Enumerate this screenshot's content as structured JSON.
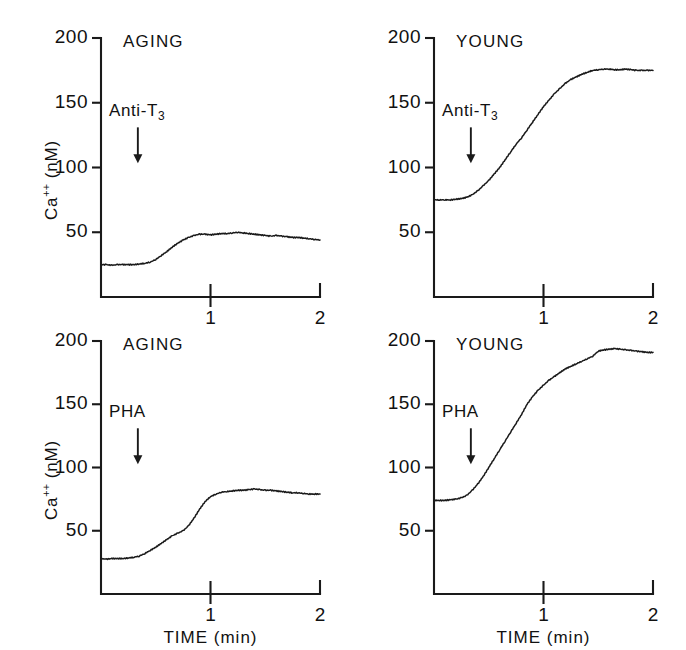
{
  "figure": {
    "background": "#ffffff",
    "ink_color": "#1a1a1a",
    "axis_label_y": "Ca++ (nM)",
    "axis_label_y_base": "Ca",
    "axis_label_y_sup": "++",
    "axis_label_y_unit": " (nM)",
    "axis_label_x": "TIME (min)"
  },
  "chart_data": [
    {
      "id": "aging-anti-t3",
      "type": "line",
      "title": "AGING",
      "annotation": "Anti-T3",
      "annotation_base": "Anti-T",
      "annotation_sub": "3",
      "annotation_time": 0.3,
      "xlabel": "TIME (min)",
      "ylabel": "Ca++ (nM)",
      "xlim": [
        0,
        2
      ],
      "ylim": [
        0,
        200
      ],
      "yticks": [
        50,
        100,
        150,
        200
      ],
      "ytick_labels": [
        "50",
        "100",
        "150",
        "200"
      ],
      "xticks": [
        1,
        2
      ],
      "xtick_labels": [
        "1",
        "2"
      ],
      "grid": false,
      "legend": "none",
      "baseline_value": 25,
      "peak_value": 50,
      "final_value": 44,
      "x": [
        0.0,
        0.05,
        0.1,
        0.15,
        0.2,
        0.25,
        0.3,
        0.35,
        0.4,
        0.45,
        0.5,
        0.55,
        0.6,
        0.65,
        0.7,
        0.75,
        0.8,
        0.85,
        0.9,
        0.95,
        1.0,
        1.05,
        1.1,
        1.15,
        1.2,
        1.25,
        1.3,
        1.35,
        1.4,
        1.45,
        1.5,
        1.55,
        1.6,
        1.65,
        1.7,
        1.75,
        1.8,
        1.85,
        1.9,
        1.95,
        2.0
      ],
      "y": [
        25,
        25,
        24.5,
        25,
        25,
        25,
        25,
        25.5,
        26,
        27,
        29,
        32,
        35,
        38.5,
        41.5,
        44,
        46,
        47.5,
        48.5,
        48.5,
        48,
        48.5,
        49,
        49,
        49.5,
        50,
        49.5,
        49,
        48.5,
        48,
        47.5,
        47,
        47.5,
        47,
        46.5,
        46,
        46,
        45.5,
        45,
        44.5,
        44
      ]
    },
    {
      "id": "young-anti-t3",
      "type": "line",
      "title": "YOUNG",
      "annotation": "Anti-T3",
      "annotation_base": "Anti-T",
      "annotation_sub": "3",
      "annotation_time": 0.3,
      "xlabel": "TIME (min)",
      "ylabel": "Ca++ (nM)",
      "xlim": [
        0,
        2
      ],
      "ylim": [
        0,
        200
      ],
      "yticks": [
        50,
        100,
        150,
        200
      ],
      "ytick_labels": [
        "50",
        "100",
        "150",
        "200"
      ],
      "xticks": [
        1,
        2
      ],
      "xtick_labels": [
        "1",
        "2"
      ],
      "grid": false,
      "legend": "none",
      "baseline_value": 75,
      "peak_value": 176,
      "final_value": 175,
      "x": [
        0.0,
        0.05,
        0.1,
        0.15,
        0.2,
        0.25,
        0.3,
        0.35,
        0.4,
        0.45,
        0.5,
        0.55,
        0.6,
        0.65,
        0.7,
        0.75,
        0.8,
        0.85,
        0.9,
        0.95,
        1.0,
        1.05,
        1.1,
        1.15,
        1.2,
        1.25,
        1.3,
        1.35,
        1.4,
        1.45,
        1.5,
        1.55,
        1.6,
        1.65,
        1.7,
        1.75,
        1.8,
        1.85,
        1.9,
        1.95,
        2.0
      ],
      "y": [
        75,
        75,
        75,
        75,
        75.5,
        76,
        77,
        79,
        82,
        86,
        90,
        95,
        100,
        106,
        112,
        118,
        123,
        129,
        135,
        141,
        147,
        152,
        157,
        161,
        165,
        168,
        170,
        172,
        173.5,
        175,
        175.5,
        176,
        176,
        175.5,
        175.5,
        176,
        175.5,
        175,
        175,
        175,
        175
      ]
    },
    {
      "id": "aging-pha",
      "type": "line",
      "title": "AGING",
      "annotation": "PHA",
      "annotation_base": "PHA",
      "annotation_sub": "",
      "annotation_time": 0.3,
      "xlabel": "TIME (min)",
      "ylabel": "Ca++ (nM)",
      "xlim": [
        0,
        2
      ],
      "ylim": [
        0,
        200
      ],
      "yticks": [
        50,
        100,
        150,
        200
      ],
      "ytick_labels": [
        "50",
        "100",
        "150",
        "200"
      ],
      "xticks": [
        1,
        2
      ],
      "xtick_labels": [
        "1",
        "2"
      ],
      "grid": false,
      "legend": "none",
      "baseline_value": 28,
      "peak_value": 83,
      "final_value": 79,
      "x": [
        0.0,
        0.05,
        0.1,
        0.15,
        0.2,
        0.25,
        0.3,
        0.35,
        0.4,
        0.45,
        0.5,
        0.55,
        0.6,
        0.65,
        0.7,
        0.75,
        0.8,
        0.85,
        0.9,
        0.95,
        1.0,
        1.05,
        1.1,
        1.15,
        1.2,
        1.25,
        1.3,
        1.35,
        1.4,
        1.45,
        1.5,
        1.55,
        1.6,
        1.65,
        1.7,
        1.75,
        1.8,
        1.85,
        1.9,
        1.95,
        2.0
      ],
      "y": [
        28,
        27.5,
        28,
        28,
        28,
        28.5,
        29,
        30,
        32,
        34.5,
        37,
        40,
        43,
        46,
        48,
        50,
        54,
        60,
        67,
        73,
        77,
        79,
        80.5,
        81,
        81.5,
        82,
        82,
        82.5,
        83,
        82.5,
        82,
        82,
        81.5,
        81,
        80.5,
        80,
        80,
        79.5,
        79,
        79,
        79
      ]
    },
    {
      "id": "young-pha",
      "type": "line",
      "title": "YOUNG",
      "annotation": "PHA",
      "annotation_base": "PHA",
      "annotation_sub": "",
      "annotation_time": 0.3,
      "xlabel": "TIME (min)",
      "ylabel": "Ca++ (nM)",
      "xlim": [
        0,
        2
      ],
      "ylim": [
        0,
        200
      ],
      "yticks": [
        50,
        100,
        150,
        200
      ],
      "ytick_labels": [
        "50",
        "100",
        "150",
        "200"
      ],
      "xticks": [
        1,
        2
      ],
      "xtick_labels": [
        "1",
        "2"
      ],
      "grid": false,
      "legend": "none",
      "baseline_value": 74,
      "peak_value": 194,
      "final_value": 191,
      "x": [
        0.0,
        0.05,
        0.1,
        0.15,
        0.2,
        0.25,
        0.3,
        0.35,
        0.4,
        0.45,
        0.5,
        0.55,
        0.6,
        0.65,
        0.7,
        0.75,
        0.8,
        0.85,
        0.9,
        0.95,
        1.0,
        1.05,
        1.1,
        1.15,
        1.2,
        1.25,
        1.3,
        1.35,
        1.4,
        1.45,
        1.5,
        1.55,
        1.6,
        1.65,
        1.7,
        1.75,
        1.8,
        1.85,
        1.9,
        1.95,
        2.0
      ],
      "y": [
        74,
        74,
        74,
        74.5,
        75,
        76,
        78,
        82,
        87,
        93,
        100,
        107,
        114,
        121,
        128,
        135,
        142,
        150,
        156,
        161,
        165,
        169,
        172,
        175,
        178,
        180,
        182,
        184,
        186,
        188,
        192,
        193,
        193.5,
        194,
        193.5,
        193,
        192.5,
        192,
        191.5,
        191,
        191
      ]
    }
  ]
}
